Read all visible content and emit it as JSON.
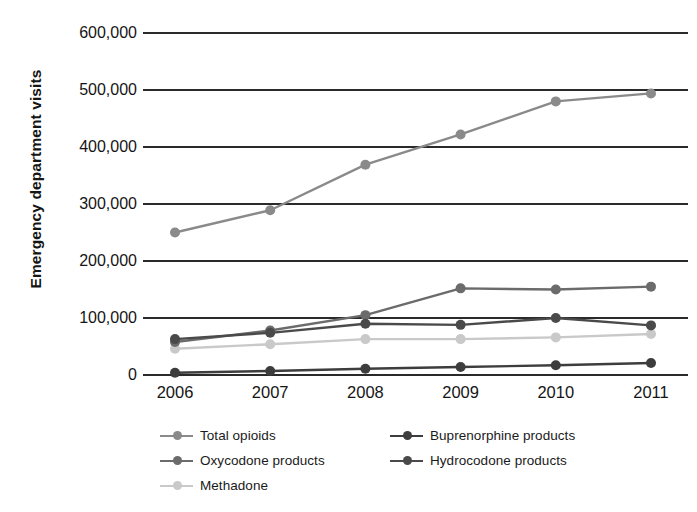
{
  "chart_data": {
    "type": "line",
    "title": "",
    "xlabel": "",
    "ylabel": "Emergency department visits",
    "categories": [
      "2006",
      "2007",
      "2008",
      "2009",
      "2010",
      "2011"
    ],
    "ylim": [
      0,
      600000
    ],
    "yticks": [
      {
        "value": 600000,
        "label": "600,000"
      },
      {
        "value": 500000,
        "label": "500,000"
      },
      {
        "value": 400000,
        "label": "400,000"
      },
      {
        "value": 300000,
        "label": "300,000"
      },
      {
        "value": 200000,
        "label": "200,000"
      },
      {
        "value": 100000,
        "label": "100,000"
      },
      {
        "value": 0,
        "label": "0"
      }
    ],
    "grid": true,
    "legend_position": "bottom",
    "series": [
      {
        "name": "Total opioids",
        "color": "#8a8a8a",
        "values": [
          250000,
          289000,
          369000,
          422000,
          480000,
          494000
        ]
      },
      {
        "name": "Oxycodone products",
        "color": "#6b6b6b",
        "values": [
          58000,
          78000,
          105000,
          152000,
          150000,
          155000
        ]
      },
      {
        "name": "Methadone",
        "color": "#c9c9c9",
        "values": [
          46000,
          54000,
          63000,
          63000,
          66000,
          72000
        ]
      },
      {
        "name": "Buprenorphine products",
        "color": "#3d3d3d",
        "values": [
          4000,
          7000,
          11000,
          14000,
          17000,
          21000
        ]
      },
      {
        "name": "Hydrocodone products",
        "color": "#4a4a4a",
        "values": [
          63000,
          74000,
          90000,
          88000,
          100000,
          87000
        ]
      }
    ]
  },
  "legend": {
    "rows": [
      [
        {
          "key": "total-opioids",
          "label": "Total opioids",
          "color": "#8a8a8a"
        },
        {
          "key": "buprenorphine-products",
          "label": "Buprenorphine products",
          "color": "#3d3d3d"
        }
      ],
      [
        {
          "key": "oxycodone-products",
          "label": "Oxycodone products",
          "color": "#6b6b6b"
        },
        {
          "key": "hydrocodone-products",
          "label": "Hydrocodone products",
          "color": "#4a4a4a"
        }
      ],
      [
        {
          "key": "methadone",
          "label": "Methadone",
          "color": "#c9c9c9"
        }
      ]
    ]
  }
}
